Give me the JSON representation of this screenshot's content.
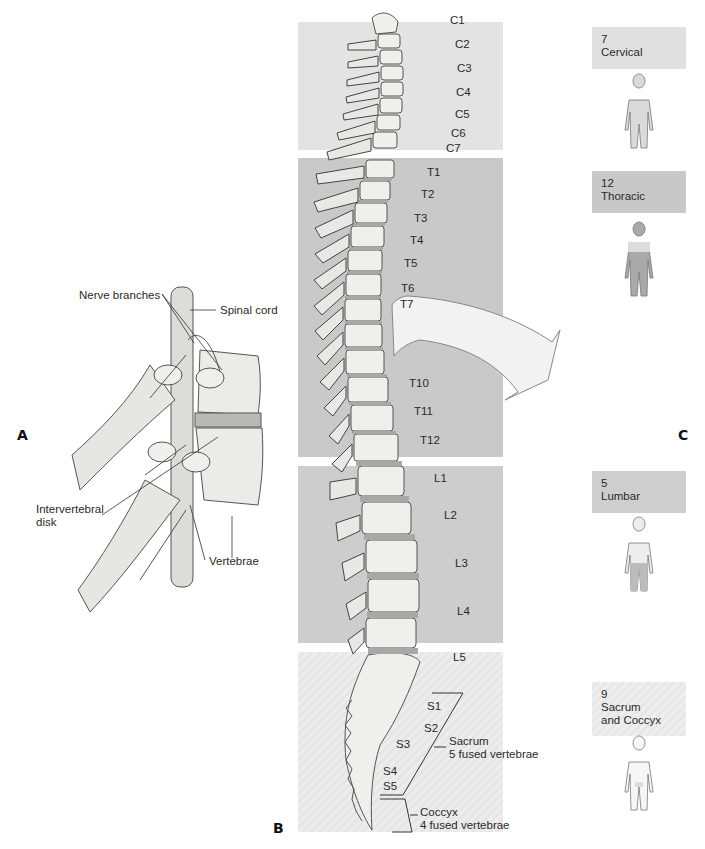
{
  "panels": {
    "a": {
      "letter": "A",
      "labels": {
        "nerve_branches": "Nerve branches",
        "spinal_cord": "Spinal cord",
        "intervertebral_disk_line1": "Intervertebral",
        "intervertebral_disk_line2": "disk",
        "vertebrae": "Vertebrae"
      }
    },
    "b": {
      "letter": "B",
      "cervical": [
        "C1",
        "C2",
        "C3",
        "C4",
        "C5",
        "C6",
        "C7"
      ],
      "thoracic_visible": [
        "T1",
        "T2",
        "T3",
        "T4",
        "T5",
        "T6",
        "T7",
        "T10",
        "T11",
        "T12"
      ],
      "lumbar": [
        "L1",
        "L2",
        "L3",
        "L4",
        "L5"
      ],
      "sacral": [
        "S1",
        "S2",
        "S3",
        "S4",
        "S5"
      ],
      "sacrum_note": {
        "line1": "Sacrum",
        "line2": "5 fused vertebrae"
      },
      "coccyx_note": {
        "line1": "Coccyx",
        "line2": "4 fused vertebrae"
      }
    },
    "c": {
      "letter": "C",
      "regions": [
        {
          "count": "7",
          "name": "Cervical"
        },
        {
          "count": "12",
          "name": "Thoracic"
        },
        {
          "count": "5",
          "name": "Lumbar"
        },
        {
          "count": "9",
          "name": "Sacrum",
          "name2": "and Coccyx"
        }
      ]
    }
  },
  "colors": {
    "cervical_band": "#e3e3e3",
    "thoracic_band": "#c9c9c9",
    "lumbar_band": "#cdcdcd",
    "sacral_band": "#ececec",
    "bone": "#efefec",
    "bone_outline": "#555555",
    "disk": "#9a9a9a",
    "figure_fill": "#d6d6d6",
    "figure_highlight": "#a9a9a9"
  }
}
